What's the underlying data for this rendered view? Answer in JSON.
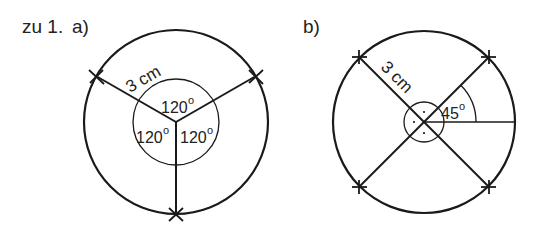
{
  "figure": {
    "heading": "zu 1.",
    "part_a": {
      "label": "a)",
      "radius_label": "3 cm",
      "angles": [
        "120°",
        "120°",
        "120°"
      ],
      "angle_values": [
        120,
        120,
        120
      ],
      "angle_text": {
        "top": "120",
        "left": "120",
        "right": "120",
        "degree": "o"
      }
    },
    "part_b": {
      "label": "b)",
      "radius_label": "3 cm",
      "angle_text": {
        "value": "45",
        "degree": "o"
      },
      "right_angle_markers": 4,
      "angle_values": [
        45,
        90,
        90,
        90,
        90
      ]
    },
    "colors": {
      "stroke": "#1a1a1a",
      "background": "#ffffff"
    }
  }
}
